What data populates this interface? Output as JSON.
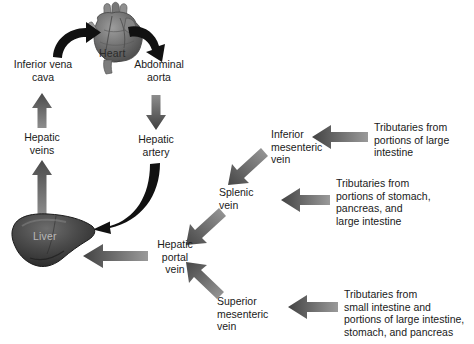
{
  "figure": {
    "background_color": "#ffffff",
    "text_color": "#1a1a1a",
    "arrow_gradient_dark": "#4a4a4a",
    "arrow_gradient_light": "#8d8d8d",
    "arrow_black": "#111111",
    "organ_dark": "#3c3c3c",
    "organ_mid": "#6e6e6e",
    "organ_light": "#a8a8a8"
  },
  "organs": [
    {
      "id": "heart",
      "label": "Heart",
      "label_color": "#2b2b2b"
    },
    {
      "id": "liver",
      "label": "Liver",
      "label_color": "#b9b9b9"
    }
  ],
  "nodes": [
    {
      "id": "inferior-vena-cava",
      "label": "Inferior vena\ncava"
    },
    {
      "id": "abdominal-aorta",
      "label": "Abdominal\naorta"
    },
    {
      "id": "hepatic-veins",
      "label": "Hepatic\nveins"
    },
    {
      "id": "hepatic-artery",
      "label": "Hepatic\nartery"
    },
    {
      "id": "hepatic-portal-vein",
      "label": "Hepatic\nportal\nvein"
    },
    {
      "id": "inferior-mesenteric-vein",
      "label": "Inferior\nmesenteric\nvein"
    },
    {
      "id": "splenic-vein",
      "label": "Splenic\nvein"
    },
    {
      "id": "superior-mesenteric-vein",
      "label": "Superior\nmesenteric\nvein"
    },
    {
      "id": "tributaries-large-intestine",
      "label": "Tributaries from\nportions of large\nintestine"
    },
    {
      "id": "tributaries-stomach-pancreas",
      "label": "Tributaries from\nportions of stomach,\npancreas, and\nlarge intestine"
    },
    {
      "id": "tributaries-small-intestine",
      "label": "Tributaries from\nsmall intestine and\nportions of large intestine,\nstomach, and pancreas"
    }
  ],
  "flows": [
    {
      "id": "flow-vena-cava-to-heart",
      "from": "inferior-vena-cava",
      "to": "heart",
      "style": "curved-black"
    },
    {
      "id": "flow-heart-to-aorta",
      "from": "heart",
      "to": "abdominal-aorta",
      "style": "curved-black"
    },
    {
      "id": "flow-hepatic-veins-to-vena-cava",
      "from": "hepatic-veins",
      "to": "inferior-vena-cava",
      "style": "straight-up"
    },
    {
      "id": "flow-liver-to-hepatic-veins",
      "from": "liver",
      "to": "hepatic-veins",
      "style": "straight-up"
    },
    {
      "id": "flow-aorta-to-hepatic-artery",
      "from": "abdominal-aorta",
      "to": "hepatic-artery",
      "style": "straight-down"
    },
    {
      "id": "flow-hepatic-artery-to-liver",
      "from": "hepatic-artery",
      "to": "liver",
      "style": "curved-black"
    },
    {
      "id": "flow-portal-vein-to-liver",
      "from": "hepatic-portal-vein",
      "to": "liver",
      "style": "straight-left"
    },
    {
      "id": "flow-splenic-to-portal",
      "from": "splenic-vein",
      "to": "hepatic-portal-vein",
      "style": "diagonal-down-left"
    },
    {
      "id": "flow-imv-to-splenic",
      "from": "inferior-mesenteric-vein",
      "to": "splenic-vein",
      "style": "diagonal-down-left"
    },
    {
      "id": "flow-smv-to-portal",
      "from": "superior-mesenteric-vein",
      "to": "hepatic-portal-vein",
      "style": "diagonal-up-left"
    },
    {
      "id": "flow-trib-large-intestine-to-imv",
      "from": "tributaries-large-intestine",
      "to": "inferior-mesenteric-vein",
      "style": "straight-left"
    },
    {
      "id": "flow-trib-stomach-to-splenic",
      "from": "tributaries-stomach-pancreas",
      "to": "splenic-vein",
      "style": "straight-left"
    },
    {
      "id": "flow-trib-small-intestine-to-smv",
      "from": "tributaries-small-intestine",
      "to": "superior-mesenteric-vein",
      "style": "straight-left"
    }
  ]
}
